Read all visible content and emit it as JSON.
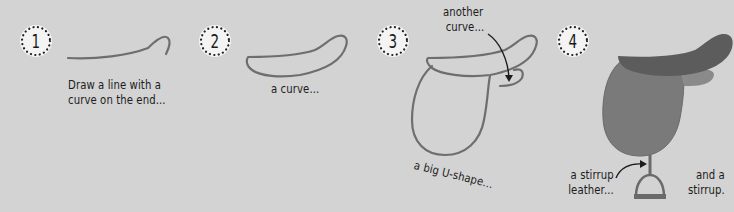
{
  "colors": {
    "background": "#d3d3d3",
    "line": "#6e6e6e",
    "badge_fill": "#f4f4f4",
    "badge_dots": "#222222",
    "text": "#1c1c1c",
    "saddle_flap": "#7a7a7a",
    "saddle_seat": "#5c5c5c",
    "saddle_knee_roll": "#8a8a8a",
    "stirrup": "#6a6a6a"
  },
  "steps": [
    {
      "number": "1",
      "captions": [
        "Draw a line with a",
        "curve on the end..."
      ]
    },
    {
      "number": "2",
      "captions": [
        "a curve..."
      ]
    },
    {
      "number": "3",
      "captions": {
        "top_line1": "another",
        "top_line2": "curve...",
        "bottom": "a big U-shape..."
      }
    },
    {
      "number": "4",
      "captions": {
        "left_line1": "a stirrup",
        "left_line2": "leather...",
        "right_line1": "and a",
        "right_line2": "stirrup."
      }
    }
  ],
  "icons": {
    "step_badge": "dotted-circle",
    "pointer_arrow": "curved-arrow"
  }
}
